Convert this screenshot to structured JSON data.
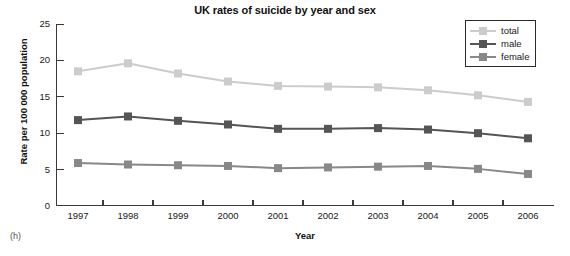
{
  "figure": {
    "caption_label": "(h)"
  },
  "chart_data": {
    "type": "line",
    "title": "UK rates of suicide by year and sex",
    "xlabel": "Year",
    "ylabel": "Rate per 100 000 population",
    "categories": [
      "1997",
      "1998",
      "1999",
      "2000",
      "2001",
      "2002",
      "2003",
      "2004",
      "2005",
      "2006"
    ],
    "x": [
      1997,
      1998,
      1999,
      2000,
      2001,
      2002,
      2003,
      2004,
      2005,
      2006
    ],
    "ylim": [
      0,
      25
    ],
    "yticks": [
      0,
      5,
      10,
      15,
      20,
      25
    ],
    "ytick_labels": [
      "0",
      "5",
      "10",
      "15",
      "20",
      "25"
    ],
    "grid": false,
    "legend_position": "top-right",
    "series": [
      {
        "name": "total",
        "color": "#cccccc",
        "values": [
          18.5,
          19.6,
          18.2,
          17.1,
          16.5,
          16.4,
          16.3,
          15.9,
          15.2,
          14.3
        ]
      },
      {
        "name": "male",
        "color": "#555555",
        "values": [
          11.8,
          12.3,
          11.7,
          11.2,
          10.6,
          10.6,
          10.7,
          10.5,
          10.0,
          9.3
        ]
      },
      {
        "name": "female",
        "color": "#888888",
        "values": [
          5.9,
          5.7,
          5.6,
          5.5,
          5.2,
          5.3,
          5.4,
          5.5,
          5.1,
          4.4
        ]
      }
    ]
  },
  "legend": {
    "items": [
      {
        "label": "total",
        "color": "#cccccc"
      },
      {
        "label": "male",
        "color": "#555555"
      },
      {
        "label": "female",
        "color": "#888888"
      }
    ]
  }
}
